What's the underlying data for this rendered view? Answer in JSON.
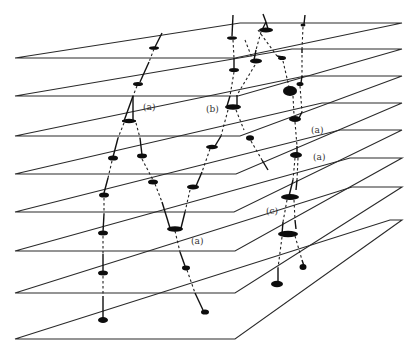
{
  "diagram": {
    "type": "stacked-planes-trajectory-diagram",
    "colors": {
      "background": "#ffffff",
      "lines": "#2a2a2a",
      "blobs": "#0d0d0d",
      "labels": "#333333"
    },
    "planes": [
      {
        "yb": 58,
        "bx": 235,
        "yt": 23,
        "tx": 240
      },
      {
        "yb": 96,
        "bx": 238,
        "yt": 49,
        "tx": 292
      },
      {
        "yb": 136,
        "bx": 240,
        "yt": 76,
        "tx": 305
      },
      {
        "yb": 174,
        "bx": 236,
        "yt": 103,
        "tx": 322
      },
      {
        "yb": 212,
        "bx": 234,
        "yt": 130,
        "tx": 340
      },
      {
        "yb": 251,
        "bx": 235,
        "yt": 158,
        "tx": 350
      },
      {
        "yb": 293,
        "bx": 235,
        "yt": 187,
        "tx": 352
      },
      {
        "yb": 339,
        "bx": 235,
        "yt": 220,
        "tx": 390
      }
    ],
    "labels": [
      {
        "id": "label-a-1",
        "text": "(a)",
        "x": 143,
        "y": 110
      },
      {
        "id": "label-b",
        "text": "(b)",
        "x": 206,
        "y": 112
      },
      {
        "id": "label-a-2",
        "text": "(a)",
        "x": 311,
        "y": 133
      },
      {
        "id": "label-a-3",
        "text": "(a)",
        "x": 313,
        "y": 160
      },
      {
        "id": "label-c",
        "text": "(c)",
        "x": 266,
        "y": 214
      },
      {
        "id": "label-a-4",
        "text": "(a)",
        "x": 191,
        "y": 244
      }
    ]
  }
}
